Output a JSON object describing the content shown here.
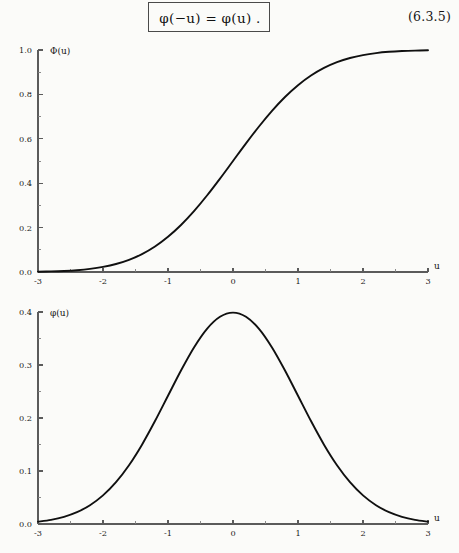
{
  "page": {
    "background_color": "#fbfbf9",
    "ink_color": "#101010"
  },
  "equation": {
    "boxed_formula": "φ(−u) = φ(u) .",
    "number": "(6.3.5)"
  },
  "chart_data": [
    {
      "id": "cdf",
      "type": "line",
      "title": "",
      "xlabel": "u",
      "ylabel": "Φ(u)",
      "xlim": [
        -3,
        3
      ],
      "ylim": [
        0.0,
        1.0
      ],
      "grid": false,
      "legend": null,
      "xticks": [
        -3,
        -2,
        -1,
        0,
        1,
        2,
        3
      ],
      "xticklabels": [
        "-3",
        "-2",
        "-1",
        "0",
        "1",
        "2",
        "3"
      ],
      "xminorticks": [
        -2.5,
        -1.5,
        -0.5,
        0.5,
        1.5,
        2.5
      ],
      "yticks": [
        0.0,
        0.2,
        0.4,
        0.6,
        0.8,
        1.0
      ],
      "yticklabels": [
        "0.0",
        "0.2",
        "0.4",
        "0.6",
        "0.8",
        "1.0"
      ],
      "yminorticks": [
        0.1,
        0.3,
        0.5,
        0.7,
        0.9
      ],
      "series": [
        {
          "name": "Φ(u)",
          "x": [
            -3.0,
            -2.8,
            -2.6,
            -2.4,
            -2.2,
            -2.0,
            -1.8,
            -1.6,
            -1.4,
            -1.2,
            -1.0,
            -0.8,
            -0.6,
            -0.4,
            -0.2,
            0.0,
            0.2,
            0.4,
            0.6,
            0.8,
            1.0,
            1.2,
            1.4,
            1.6,
            1.8,
            2.0,
            2.2,
            2.4,
            2.6,
            2.8,
            3.0
          ],
          "y": [
            0.0013,
            0.0026,
            0.0047,
            0.0082,
            0.0139,
            0.0228,
            0.0359,
            0.0548,
            0.0808,
            0.1151,
            0.1587,
            0.2119,
            0.2743,
            0.3446,
            0.4207,
            0.5,
            0.5793,
            0.6554,
            0.7257,
            0.7881,
            0.8413,
            0.8849,
            0.9192,
            0.9452,
            0.9641,
            0.9772,
            0.9861,
            0.9918,
            0.9953,
            0.9974,
            0.9987
          ]
        }
      ]
    },
    {
      "id": "pdf",
      "type": "line",
      "title": "",
      "xlabel": "u",
      "ylabel": "φ(u)",
      "xlim": [
        -3,
        3
      ],
      "ylim": [
        0.0,
        0.4
      ],
      "grid": false,
      "legend": null,
      "xticks": [
        -3,
        -2,
        -1,
        0,
        1,
        2,
        3
      ],
      "xticklabels": [
        "-3",
        "-2",
        "-1",
        "0",
        "1",
        "2",
        "3"
      ],
      "xminorticks": [
        -2.5,
        -1.5,
        -0.5,
        0.5,
        1.5,
        2.5
      ],
      "yticks": [
        0.0,
        0.1,
        0.2,
        0.3,
        0.4
      ],
      "yticklabels": [
        "0.0",
        "0.1",
        "0.2",
        "0.3",
        "0.4"
      ],
      "yminorticks": [
        0.05,
        0.15,
        0.25,
        0.35
      ],
      "series": [
        {
          "name": "φ(u)",
          "x": [
            -3.0,
            -2.8,
            -2.6,
            -2.4,
            -2.2,
            -2.0,
            -1.8,
            -1.6,
            -1.4,
            -1.2,
            -1.0,
            -0.8,
            -0.6,
            -0.4,
            -0.2,
            0.0,
            0.2,
            0.4,
            0.6,
            0.8,
            1.0,
            1.2,
            1.4,
            1.6,
            1.8,
            2.0,
            2.2,
            2.4,
            2.6,
            2.8,
            3.0
          ],
          "y": [
            0.0044,
            0.0079,
            0.0136,
            0.0224,
            0.0355,
            0.054,
            0.079,
            0.1109,
            0.1497,
            0.1942,
            0.242,
            0.2897,
            0.3332,
            0.3683,
            0.391,
            0.3989,
            0.391,
            0.3683,
            0.3332,
            0.2897,
            0.242,
            0.1942,
            0.1497,
            0.1109,
            0.079,
            0.054,
            0.0355,
            0.0224,
            0.0136,
            0.0079,
            0.0044
          ]
        }
      ]
    }
  ]
}
